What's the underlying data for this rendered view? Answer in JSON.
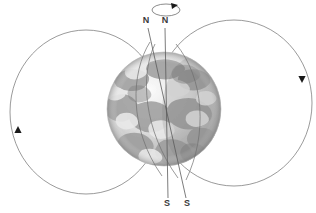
{
  "figure": {
    "type": "scientific-diagram",
    "width": 316,
    "height": 213,
    "background_color": "#ffffff"
  },
  "labels": {
    "north_rotational": "N",
    "north_magnetic": "N",
    "south_rotational": "S",
    "south_magnetic": "S"
  },
  "label_positions": {
    "north_magnetic": {
      "x": 146,
      "y": 23
    },
    "north_rotational": {
      "x": 165,
      "y": 23
    },
    "south_rotational": {
      "x": 167,
      "y": 206
    },
    "south_magnetic": {
      "x": 187,
      "y": 206
    }
  },
  "globe": {
    "name": "earth-globe",
    "center_x": 164,
    "center_y": 109,
    "radius": 57,
    "description": "grayscale Earth showing continents and cloud cover",
    "land_tone": "#9a9a9a",
    "ocean_tone": "#e2e2e2",
    "shadow_tone": "#8d8d8d"
  },
  "axes": [
    {
      "name": "rotational-axis",
      "label_top": "N",
      "label_bottom": "S",
      "top_x": 165,
      "top_y": 28,
      "bottom_x": 168,
      "bottom_y": 198,
      "tilt_degrees": 1
    },
    {
      "name": "magnetic-axis",
      "label_top": "N",
      "label_bottom": "S",
      "top_x": 148,
      "top_y": 28,
      "bottom_x": 186,
      "bottom_y": 198,
      "tilt_degrees": 11
    }
  ],
  "spin_indicator": {
    "name": "rotation-direction-ellipse",
    "center_x": 166,
    "center_y": 10,
    "rx": 14,
    "ry": 6,
    "arrow_x": 174,
    "arrow_y": 5,
    "direction": "counterclockwise-viewed-from-north"
  },
  "field_loops": [
    {
      "name": "field-loop-left",
      "side": "left",
      "center_x": 86,
      "center_y": 112,
      "rx": 76,
      "ry": 82,
      "arrow_x": 18,
      "arrow_y": 131,
      "arrow_direction": "up"
    },
    {
      "name": "field-loop-right",
      "side": "right",
      "center_x": 234,
      "center_y": 103,
      "rx": 78,
      "ry": 83,
      "arrow_x": 302,
      "arrow_y": 77,
      "arrow_direction": "down"
    }
  ],
  "colors": {
    "line_stroke": "#6e6e6e",
    "axis_stroke": "#5a5a5a",
    "label_fill": "#3a3a3a",
    "arrow_fill": "#1a1a1a"
  }
}
